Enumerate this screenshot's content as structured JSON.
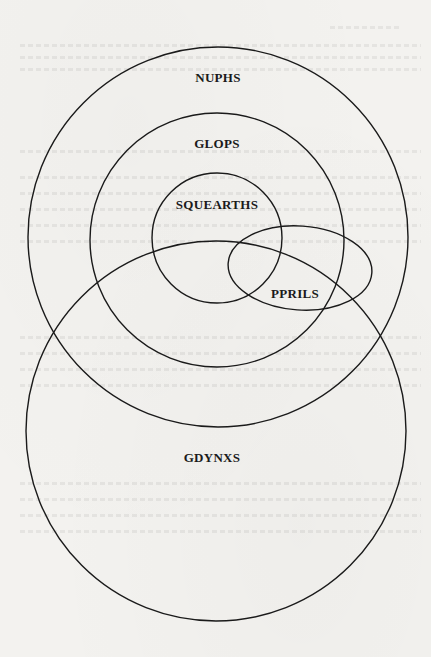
{
  "diagram": {
    "type": "euler-venn",
    "sets": [
      {
        "id": "nuphs",
        "label": "NUPHS"
      },
      {
        "id": "glops",
        "label": "GLOPS"
      },
      {
        "id": "squearths",
        "label": "SQUEARTHS"
      },
      {
        "id": "pprils",
        "label": "PPRILS"
      },
      {
        "id": "gdynxs",
        "label": "GDYNXS"
      }
    ],
    "relationships": [
      "SQUEARTHS is contained in GLOPS",
      "GLOPS is contained in NUPHS",
      "PPRILS overlaps SQUEARTHS, GLOPS, NUPHS and GDYNXS",
      "GDYNXS overlaps NUPHS, GLOPS and SQUEARTHS"
    ]
  },
  "background": {
    "note": "faint illegible bleed-through text from reverse of scanned page"
  }
}
